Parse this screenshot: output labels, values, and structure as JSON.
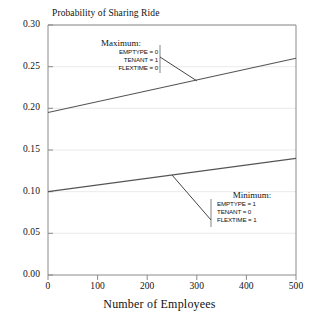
{
  "chart_data": {
    "type": "line",
    "title": "Probability of Sharing Ride",
    "xlabel": "Number of Employees",
    "ylabel": "",
    "xlim": [
      0,
      500
    ],
    "ylim": [
      0.0,
      0.3
    ],
    "grid": true,
    "legend_position": "none",
    "xticks": [
      "0",
      "100",
      "200",
      "300",
      "400",
      "500"
    ],
    "xtick_values": [
      0,
      100,
      200,
      300,
      400,
      500
    ],
    "yticks": [
      "0.00",
      "0.05",
      "0.10",
      "0.15",
      "0.20",
      "0.25",
      "0.30"
    ],
    "ytick_values": [
      0.0,
      0.05,
      0.1,
      0.15,
      0.2,
      0.25,
      0.3
    ],
    "x": [
      0,
      500
    ],
    "series": [
      {
        "name": "Maximum",
        "values": [
          0.195,
          0.26
        ]
      },
      {
        "name": "Minimum",
        "values": [
          0.1,
          0.14
        ]
      }
    ],
    "annotations": [
      {
        "id": "maximum",
        "heading": "Maximum:",
        "lines": [
          "EMPTYPE = 0",
          "TENANT = 1",
          "FLEXTIME = 0"
        ],
        "attach_x": 300,
        "attach_y": 0.233
      },
      {
        "id": "minimum",
        "heading": "Minimum:",
        "lines": [
          "EMPTYPE = 1",
          "TENANT = 0",
          "FLEXTIME = 1"
        ],
        "attach_x": 250,
        "attach_y": 0.12
      }
    ]
  },
  "colors": {
    "line": "#555555",
    "axis": "#808080",
    "grid": "#e2e2e2",
    "text": "#111111",
    "background": "#ffffff"
  }
}
